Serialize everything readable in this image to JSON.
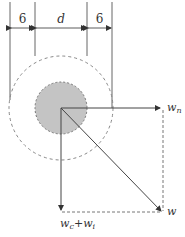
{
  "diagram": {
    "dimensions": {
      "left_label": "6",
      "middle_label": "d",
      "right_label": "6"
    },
    "vectors": {
      "normal": {
        "label": "w",
        "subscript": "n"
      },
      "tangential": {
        "label": "w",
        "subscript": "c",
        "plus": "+",
        "label2": "w",
        "subscript2": "i"
      },
      "resultant": {
        "label": "w"
      }
    },
    "colors": {
      "line": "#555555",
      "dashed": "#888888",
      "fill": "#c4c4c4"
    }
  }
}
